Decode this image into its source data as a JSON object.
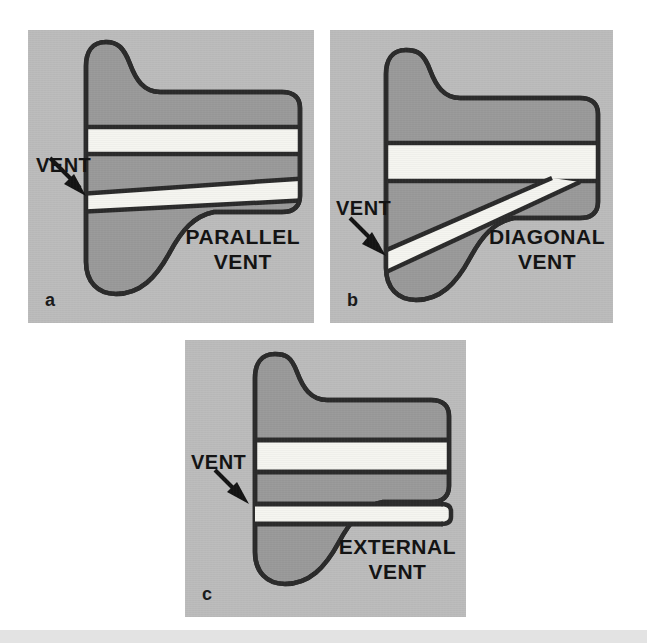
{
  "figure": {
    "name": "dental-vent-types-figure",
    "background_color": "#ffffff",
    "panel_background_color": "#bcbcbc",
    "body_fill_color": "#9a9a9a",
    "vent_fill_color": "#f5f5f0",
    "outline_color": "#2b2b2b",
    "bottom_band_color": "#e3e3e3"
  },
  "panels": [
    {
      "letter": "a",
      "name": "panel-parallel-vent",
      "vent_label": "VENT",
      "type_label_line1": "PARALLEL",
      "type_label_line2": "VENT",
      "description": "Die with two parallel vent bands; lower band slightly tapered"
    },
    {
      "letter": "b",
      "name": "panel-diagonal-vent",
      "vent_label": "VENT",
      "type_label_line1": "DIAGONAL",
      "type_label_line2": "VENT",
      "description": "Die with one horizontal vent band and one diagonal vent band branching downward-left"
    },
    {
      "letter": "c",
      "name": "panel-external-vent",
      "vent_label": "VENT",
      "type_label_line1": "EXTERNAL",
      "type_label_line2": "VENT",
      "description": "Die with two horizontal vent bands, the lower band extending beyond the body contour"
    }
  ],
  "icons": {
    "arrow": "arrow-pointer-icon"
  }
}
